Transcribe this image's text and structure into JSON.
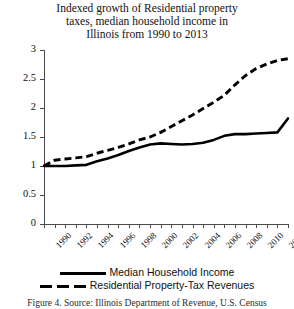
{
  "chart_data": {
    "type": "line",
    "title": "Indexed growth of Residential property taxes, median household income in Illinois from 1990 to 2013",
    "title_lines": [
      "Indexed growth of Residential property",
      "taxes, median household income in",
      "Illinois from 1990 to 2013"
    ],
    "xlabel": "",
    "ylabel": "",
    "ylim": [
      0,
      3
    ],
    "xlim": [
      1990,
      2013
    ],
    "ytick_labels": [
      "0",
      "0.5",
      "1",
      "1.5",
      "2",
      "2.5",
      "3"
    ],
    "ytick_values": [
      0,
      0.5,
      1,
      1.5,
      2,
      2.5,
      3
    ],
    "xtick_labels": [
      "1990",
      "1992",
      "1994",
      "1996",
      "1998",
      "2000",
      "2002",
      "2004",
      "2006",
      "2008",
      "2010",
      "2012"
    ],
    "xtick_values": [
      1990,
      1992,
      1994,
      1996,
      1998,
      2000,
      2002,
      2004,
      2006,
      2008,
      2010,
      2012
    ],
    "grid": false,
    "legend_position": "bottom",
    "x": [
      1990,
      1991,
      1992,
      1993,
      1994,
      1995,
      1996,
      1997,
      1998,
      1999,
      2000,
      2001,
      2002,
      2003,
      2004,
      2005,
      2006,
      2007,
      2008,
      2009,
      2010,
      2011,
      2012,
      2013
    ],
    "series": [
      {
        "name": "Median Household Income",
        "style": "solid",
        "color": "#000000",
        "values": [
          1.0,
          1.0,
          1.0,
          1.01,
          1.02,
          1.08,
          1.13,
          1.19,
          1.26,
          1.32,
          1.37,
          1.39,
          1.38,
          1.37,
          1.38,
          1.4,
          1.45,
          1.52,
          1.55,
          1.55,
          1.56,
          1.57,
          1.58,
          1.82
        ]
      },
      {
        "name": "Residential Property-Tax Revenues",
        "style": "dashed",
        "color": "#000000",
        "values": [
          1.0,
          1.1,
          1.12,
          1.14,
          1.16,
          1.22,
          1.27,
          1.32,
          1.38,
          1.45,
          1.5,
          1.58,
          1.68,
          1.78,
          1.88,
          1.99,
          2.1,
          2.22,
          2.4,
          2.56,
          2.68,
          2.76,
          2.82,
          2.85
        ]
      }
    ]
  },
  "legend": {
    "items": [
      {
        "label": "Median Household Income",
        "style": "solid"
      },
      {
        "label": "Residential Property-Tax Revenues",
        "style": "dashed"
      }
    ]
  },
  "caption": {
    "text": "Figure 4. Source: Illinois Department of Revenue, U.S. Census"
  }
}
